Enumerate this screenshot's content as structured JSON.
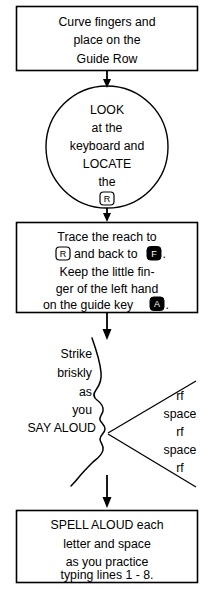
{
  "diagram": {
    "stroke_color": "#000000",
    "background_color": "#ffffff",
    "key_outline_color": "#000000",
    "key_filled_color": "#000000"
  },
  "step1": {
    "shape": "rectangle",
    "lines": [
      "Curve fingers and",
      "place on the",
      "Guide Row"
    ]
  },
  "step2": {
    "shape": "circle",
    "lines": [
      "LOOK",
      "at the",
      "keyboard and",
      "LOCATE",
      "the"
    ],
    "key": "R",
    "key_style": "outline"
  },
  "step3": {
    "shape": "rectangle",
    "line1": "Trace the reach to",
    "line2_pre": "",
    "line2_key": "R",
    "line2_mid": "and back to",
    "line2_key2": "F",
    "line2_post": ".",
    "line3": "Keep the little fin-",
    "line4": "ger of the left hand",
    "line5_pre": "on the guide key",
    "line5_key": "A",
    "line5_post": "."
  },
  "step4": {
    "shape": "speaking-profile-cone",
    "left_lines": [
      "Strike",
      "briskly",
      "as",
      "you",
      "SAY ALOUD"
    ],
    "right_lines": [
      "rf",
      "space",
      "rf",
      "space",
      "rf"
    ]
  },
  "step5": {
    "shape": "rectangle",
    "lines": [
      "SPELL ALOUD each",
      "letter and space",
      "as you practice",
      "typing lines 1 - 8."
    ]
  }
}
